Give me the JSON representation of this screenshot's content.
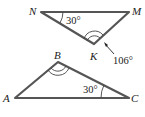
{
  "diagram": {
    "type": "geometry",
    "colors": {
      "edge": "#555555",
      "text": "#222222",
      "background": "#ffffff"
    },
    "triangles": [
      {
        "name": "NMK",
        "vertices": {
          "N": "N",
          "M": "M",
          "K": "K"
        },
        "angles": {
          "N": "30°",
          "K_exterior": "106°"
        }
      },
      {
        "name": "ABC",
        "vertices": {
          "A": "A",
          "B": "B",
          "C": "C"
        },
        "angles": {
          "C": "30°"
        }
      }
    ]
  }
}
